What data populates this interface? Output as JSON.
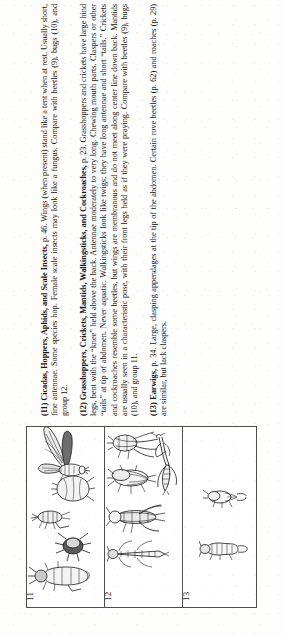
{
  "page": {
    "orientation": "rotated-90-ccw",
    "background_color": "#fdfdfc",
    "ink_color": "#131313",
    "rule_color": "#4e4e4e"
  },
  "entries": [
    {
      "number": "11",
      "label": "(11)",
      "headword": "Cicadas, Hoppers, Aphids, and Scale Insects,",
      "page_ref": "p. 46.",
      "body": "Wings (when present) stand like a tent when at rest. Usually short, fine antennae. Some species hop. Female scale insects may look like a fungus. Compare with beetles (9), bugs (10), and group 12.",
      "full_text": "(11) Cicadas, Hoppers, Aphids, and Scale Insects, p. 46. Wings (when present) stand like a tent when at rest. Usually short, fine antennae. Some species hop. Female scale insects may look like a fungus. Compare with beetles (9), bugs (10), and group 12.",
      "panel_number": "11",
      "figure_count": 5,
      "figure_names": [
        "cicada-winged",
        "scale-insect",
        "leafhopper-nymph",
        "aphid",
        "hopper-adult"
      ]
    },
    {
      "number": "12",
      "label": "(12)",
      "headword": "Grasshoppers, Crickets, Mantids, Walkingsticks, and Cockroaches,",
      "page_ref": "p. 23.",
      "body": "Grasshoppers and crickets have large hind legs, bent with the “knee” held above the back. Antennae moderately to very long. Chewing mouth parts. Claspers or other “tails” at tip of abdomen. Never aquatic. Walkingsticks look like twigs; they have long antennae and short “tails.” Crickets and cockroaches resemble some beetles, but wings are membranous and do not meet along center line down back. Mantids are usually seen in a characteristic pose, with their front legs held as if they were praying. Compare with beetles (9), bugs (10), and group 11.",
      "full_text": "(12) Grasshoppers, Crickets, Mantids, Walkingsticks, and Cockroaches, p. 23. Grasshoppers and crickets have large hind legs, bent with the “knee” held above the back. Antennae moderately to very long. Chewing mouth parts. Claspers or other “tails” at tip of abdomen. Never aquatic. Walkingsticks look like twigs; they have long antennae and short “tails.” Crickets and cockroaches resemble some beetles, but wings are membranous and do not meet along center line down back. Mantids are usually seen in a characteristic pose, with their front legs held as if they were praying. Compare with beetles (9), bugs (10), and group 11.",
      "panel_number": "12",
      "figure_count": 5,
      "figure_names": [
        "cricket",
        "cockroach",
        "mantid",
        "grasshopper",
        "walkingstick"
      ]
    },
    {
      "number": "13",
      "label": "(13)",
      "headword": "Earwigs,",
      "page_ref": "p. 34.",
      "body": "Large, clasping appendages at the tip of the abdomen. Certain rove beetles (p. 62) and roaches (p. 29) are similar, but lack claspers.",
      "full_text": "(13) Earwigs, p. 34. Large, clasping appendages at the tip of the abdomen. Certain rove beetles (p. 62) and roaches (p. 29) are similar, but lack claspers.",
      "panel_number": "13",
      "figure_count": 2,
      "figure_names": [
        "earwig-short",
        "earwig-long"
      ]
    }
  ]
}
